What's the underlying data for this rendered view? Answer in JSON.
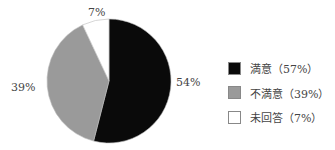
{
  "chart_data": {
    "type": "pie",
    "title": "",
    "categories": [
      "満意",
      "不満意",
      "未回答"
    ],
    "values": [
      54,
      39,
      7
    ],
    "slice_labels": [
      "54%",
      "39%",
      "7%"
    ],
    "colors": [
      "#0a0a0a",
      "#9a9a9a",
      "#ffffff"
    ],
    "start_angle_deg": 0,
    "direction": "clockwise",
    "legend": {
      "position": "right",
      "entries": [
        "満意（57%）",
        "不満意（39%）",
        "未回答（7%）"
      ]
    }
  },
  "labels": {
    "black": "54%",
    "gray": "39%",
    "white": "7%"
  },
  "legend": [
    {
      "label": "満意（57%）",
      "color": "#0a0a0a"
    },
    {
      "label": "不満意（39%）",
      "color": "#9a9a9a"
    },
    {
      "label": "未回答（7%）",
      "color": "#ffffff"
    }
  ]
}
